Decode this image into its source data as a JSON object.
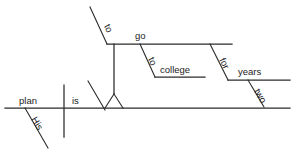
{
  "diagram": {
    "type": "reed-kellogg-sentence-diagram",
    "sentence": "His plan is to go to college for two years.",
    "ink_color": "#2b2b2b",
    "text_color": "#1b1b1b",
    "background_color": "#ffffff",
    "words": {
      "subject": "plan",
      "subject_modifier": "His",
      "verb": "is",
      "infinitive_marker_main": "to",
      "infinitive_verb": "go",
      "preposition_college": "to",
      "object_college": "college",
      "preposition_years": "for",
      "object_years": "years",
      "years_modifier": "two"
    },
    "labels": [
      {
        "id": "his",
        "text": "His"
      },
      {
        "id": "plan",
        "text": "plan"
      },
      {
        "id": "is",
        "text": "is"
      },
      {
        "id": "to-main",
        "text": "to"
      },
      {
        "id": "go",
        "text": "go"
      },
      {
        "id": "to-college",
        "text": "to"
      },
      {
        "id": "college",
        "text": "college"
      },
      {
        "id": "for",
        "text": "for"
      },
      {
        "id": "years",
        "text": "years"
      },
      {
        "id": "two",
        "text": "two"
      }
    ]
  }
}
